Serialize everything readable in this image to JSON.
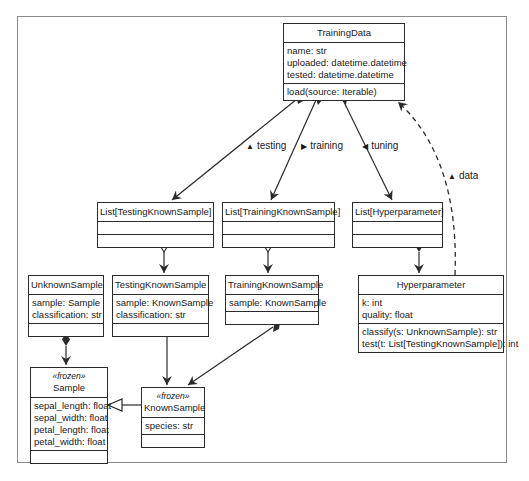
{
  "diagram": {
    "type": "UML class diagram",
    "classes": {
      "training_data": {
        "name": "TrainingData",
        "attributes": [
          "name: str",
          "uploaded: datetime.datetime",
          "tested: datetime.datetime"
        ],
        "methods": [
          "load(source: Iterable)"
        ]
      },
      "list_testing": {
        "name": "List[TestingKnownSample]",
        "attributes": [],
        "methods": []
      },
      "list_training": {
        "name": "List[TrainingKnownSample]",
        "attributes": [],
        "methods": []
      },
      "list_hyper": {
        "name": "List[Hyperparameter]",
        "attributes": [],
        "methods": []
      },
      "hyperparameter": {
        "name": "Hyperparameter",
        "attributes": [
          "k: int",
          "quality: float"
        ],
        "methods": [
          "classify(s: UnknownSample): str",
          "test(t: List[TestingKnownSample]): int"
        ]
      },
      "unknown_sample": {
        "name": "UnknownSample",
        "attributes": [
          "sample: Sample",
          "classification: str"
        ],
        "methods": []
      },
      "testing_known_sample": {
        "name": "TestingKnownSample",
        "attributes": [
          "sample: KnownSample",
          "classification: str"
        ],
        "methods": []
      },
      "training_known_sample": {
        "name": "TrainingKnownSample",
        "attributes": [
          "sample: KnownSample"
        ],
        "methods": []
      },
      "sample": {
        "stereotype": "«frozen»",
        "name": "Sample",
        "attributes": [
          "sepal_length: float",
          "sepal_width: float",
          "petal_length: float",
          "petal_width: float"
        ],
        "methods": []
      },
      "known_sample": {
        "stereotype": "«frozen»",
        "name": "KnownSample",
        "attributes": [
          "species: str"
        ],
        "methods": []
      }
    },
    "associations": {
      "testing": "testing",
      "training": "training",
      "tuning": "tuning",
      "data": "data"
    },
    "label_markers": {
      "testing": "▲",
      "training": "▶",
      "tuning": "◀",
      "data": "▲"
    },
    "colors": {
      "line": "#2b2b2b",
      "frame": "#8a8a8a",
      "background": "#ffffff"
    }
  }
}
